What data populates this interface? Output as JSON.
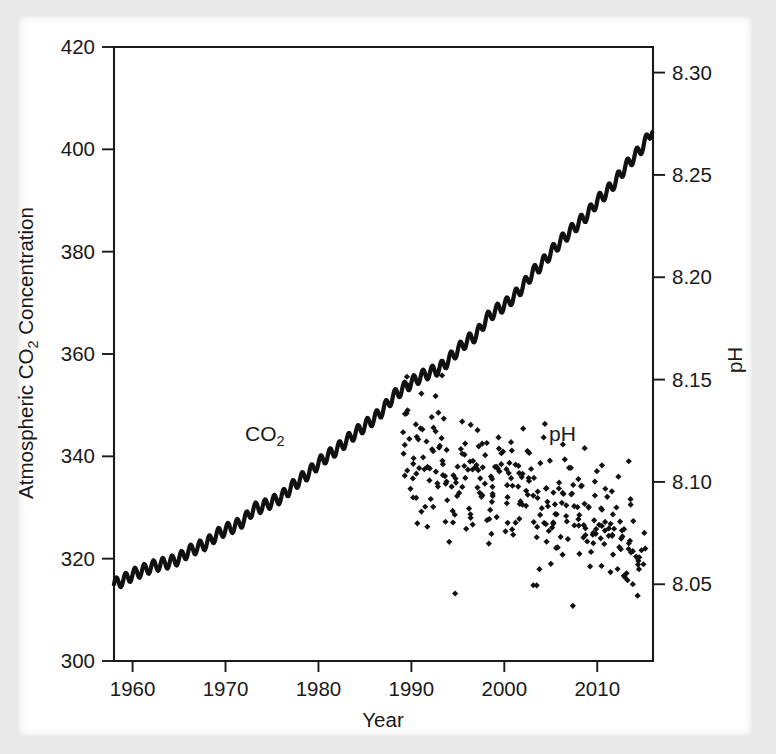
{
  "figure": {
    "name": "co2-ph-dual-axis-figure",
    "background_color": "#e9e9e9",
    "paper_color": "#ffffff",
    "ink_color": "#1a1a1a"
  },
  "labels": {
    "y_left_title_main": "Atmospheric CO",
    "y_left_title_sub": "2",
    "y_left_title_tail": " Concentration",
    "y_right_title": "pH",
    "x_title": "Year",
    "series_co2_main": "CO",
    "series_co2_sub": "2",
    "series_ph": "pH"
  },
  "chart_data": {
    "type": "line",
    "title": "",
    "xlabel": "Year",
    "ylabel": "Atmospheric CO2 Concentration",
    "y2label": "pH",
    "xlim": [
      1958,
      2016
    ],
    "ylim": [
      300,
      420
    ],
    "y2lim": [
      8.0125,
      8.3125
    ],
    "grid": false,
    "legend": "inline-annotations",
    "xticks": [
      1960,
      1970,
      1980,
      1990,
      2000,
      2010
    ],
    "xtick_labels": [
      "1960",
      "1970",
      "1980",
      "1990",
      "2000",
      "2010"
    ],
    "yticks": [
      300,
      320,
      340,
      360,
      380,
      400,
      420
    ],
    "ytick_labels": [
      "300",
      "320",
      "340",
      "360",
      "380",
      "400",
      "420"
    ],
    "y2ticks": [
      8.05,
      8.1,
      8.15,
      8.2,
      8.25,
      8.3
    ],
    "y2tick_labels": [
      "8.05",
      "8.10",
      "8.15",
      "8.20",
      "8.25",
      "8.30"
    ],
    "series": [
      {
        "name": "CO2",
        "type": "line",
        "axis": "left",
        "units": "ppm",
        "annotation": "CO2",
        "annotation_at": [
          1977.5,
          341
        ],
        "x": [
          1958,
          1959,
          1960,
          1961,
          1962,
          1963,
          1964,
          1965,
          1966,
          1967,
          1968,
          1969,
          1970,
          1971,
          1972,
          1973,
          1974,
          1975,
          1976,
          1977,
          1978,
          1979,
          1980,
          1981,
          1982,
          1983,
          1984,
          1985,
          1986,
          1987,
          1988,
          1989,
          1990,
          1991,
          1992,
          1993,
          1994,
          1995,
          1996,
          1997,
          1998,
          1999,
          2000,
          2001,
          2002,
          2003,
          2004,
          2005,
          2006,
          2007,
          2008,
          2009,
          2010,
          2011,
          2012,
          2013,
          2014,
          2015,
          2016
        ],
        "y": [
          315.0,
          315.8,
          316.9,
          317.6,
          318.4,
          318.9,
          319.3,
          320.0,
          321.4,
          322.2,
          323.0,
          324.6,
          325.7,
          326.3,
          327.5,
          329.7,
          330.2,
          331.1,
          332.0,
          333.8,
          335.4,
          336.8,
          338.7,
          340.1,
          341.4,
          343.0,
          344.6,
          346.0,
          347.4,
          349.2,
          351.6,
          353.1,
          354.4,
          355.6,
          356.4,
          357.1,
          358.8,
          360.8,
          362.6,
          363.7,
          366.7,
          368.4,
          369.5,
          371.1,
          373.2,
          375.8,
          377.5,
          379.8,
          381.9,
          383.8,
          385.6,
          387.4,
          389.9,
          391.6,
          393.8,
          396.5,
          398.6,
          400.8,
          404.2
        ]
      },
      {
        "name": "pH",
        "type": "scatter",
        "axis": "right",
        "marker": "diamond",
        "annotation": "pH",
        "annotation_at": [
          2006.5,
          8.118
        ],
        "x_range": [
          1989,
          2015
        ],
        "y_range": [
          8.038,
          8.152
        ],
        "trend_start": 8.118,
        "trend_end": 8.068,
        "n_points": 300,
        "scatter_sd": 0.016,
        "note": "Monthly ocean-surface pH observations declining over time"
      }
    ]
  }
}
